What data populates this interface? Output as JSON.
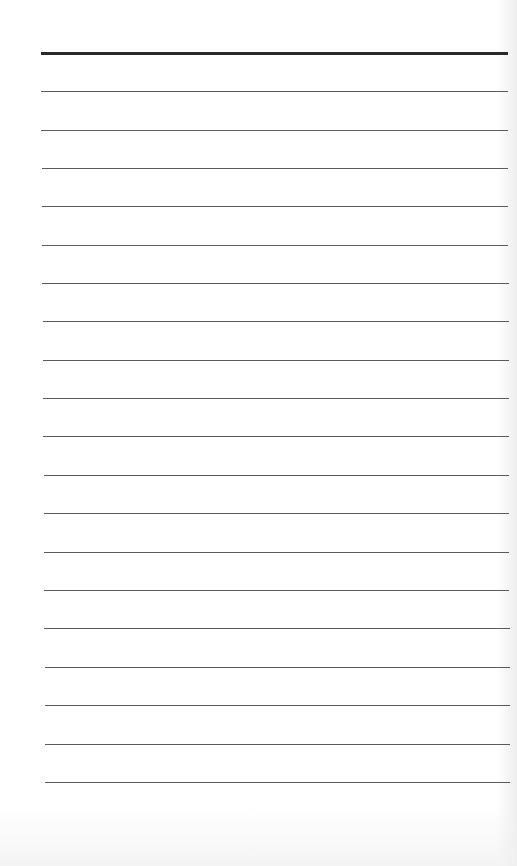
{
  "document": {
    "type": "lined-paper",
    "background_color": "#ffffff",
    "header_rule": {
      "y": 52,
      "x_start": 41,
      "x_end": 508,
      "thickness": 3,
      "color": "#2a2a2a"
    },
    "rule_color": "#5a5a5a",
    "rule_thickness": 1,
    "rules": [
      {
        "y": 91,
        "x_start": 41,
        "x_end": 508
      },
      {
        "y": 130,
        "x_start": 41,
        "x_end": 508
      },
      {
        "y": 168,
        "x_start": 42,
        "x_end": 508
      },
      {
        "y": 206,
        "x_start": 42,
        "x_end": 508
      },
      {
        "y": 245,
        "x_start": 42,
        "x_end": 508
      },
      {
        "y": 283,
        "x_start": 42,
        "x_end": 509
      },
      {
        "y": 321,
        "x_start": 43,
        "x_end": 509
      },
      {
        "y": 360,
        "x_start": 43,
        "x_end": 509
      },
      {
        "y": 398,
        "x_start": 43,
        "x_end": 509
      },
      {
        "y": 436,
        "x_start": 43,
        "x_end": 509
      },
      {
        "y": 475,
        "x_start": 44,
        "x_end": 509
      },
      {
        "y": 513,
        "x_start": 44,
        "x_end": 509
      },
      {
        "y": 552,
        "x_start": 44,
        "x_end": 509
      },
      {
        "y": 590,
        "x_start": 44,
        "x_end": 509
      },
      {
        "y": 628,
        "x_start": 44,
        "x_end": 510
      },
      {
        "y": 667,
        "x_start": 45,
        "x_end": 510
      },
      {
        "y": 705,
        "x_start": 45,
        "x_end": 510
      },
      {
        "y": 744,
        "x_start": 45,
        "x_end": 510
      },
      {
        "y": 782,
        "x_start": 45,
        "x_end": 510
      }
    ],
    "line_count": 20
  }
}
